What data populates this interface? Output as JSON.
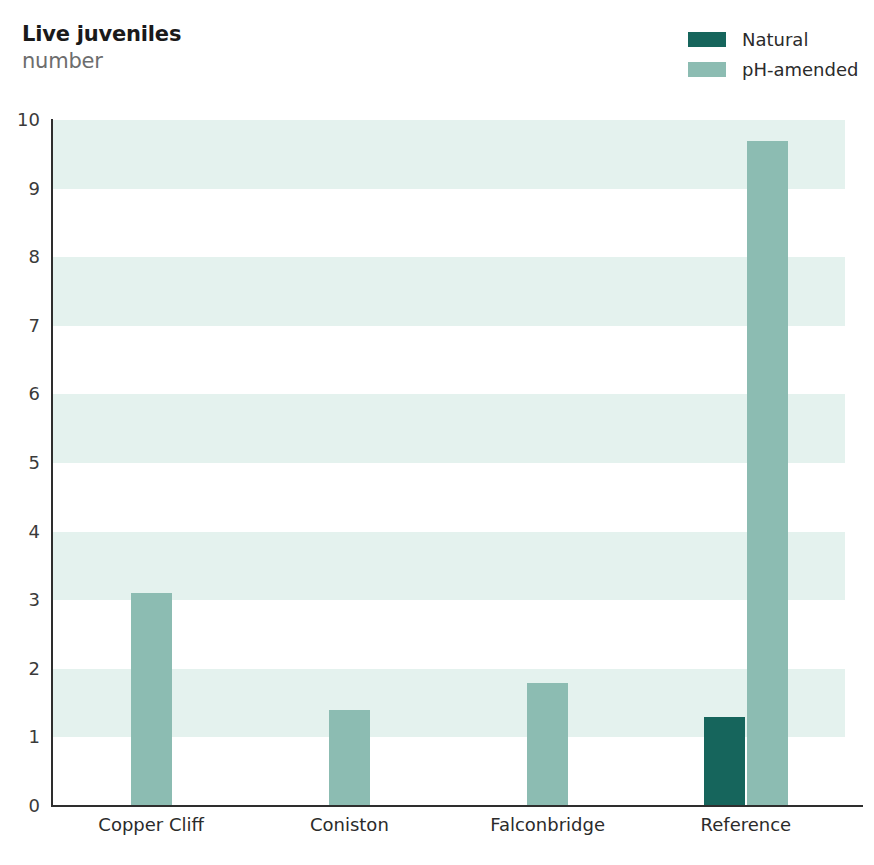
{
  "header": {
    "title": "Live juveniles",
    "subtitle": "number"
  },
  "legend": {
    "position": "top-right",
    "items": [
      {
        "label": "Natural",
        "color": "#16655c",
        "icon": "legend-swatch"
      },
      {
        "label": "pH-amended",
        "color": "#8cbcb2",
        "icon": "legend-swatch"
      }
    ]
  },
  "colors": {
    "natural": "#16655c",
    "ph_amended": "#8cbcb2",
    "band_shaded": "#e4f2ee",
    "band_plain": "#ffffff",
    "axis": "#2e2e2e",
    "title": "#1a1a1a",
    "subtitle": "#6d6d6d",
    "tick_text": "#3a3a3a"
  },
  "chart_data": {
    "type": "bar",
    "title": "Live juveniles",
    "subtitle": "number",
    "xlabel": "",
    "ylabel": "number",
    "ylim": [
      0,
      10
    ],
    "yticks": [
      0,
      1,
      2,
      3,
      4,
      5,
      6,
      7,
      8,
      9,
      10
    ],
    "ytick_labels": [
      "0",
      "1",
      "2",
      "3",
      "4",
      "5",
      "6",
      "7",
      "8",
      "9",
      "10"
    ],
    "categories": [
      "Copper Cliff",
      "Coniston",
      "Falconbridge",
      "Reference"
    ],
    "grid": false,
    "banded_background": true,
    "legend_position": "top-right",
    "series": [
      {
        "name": "Natural",
        "color": "#16655c",
        "values": [
          null,
          null,
          null,
          1.3
        ]
      },
      {
        "name": "pH-amended",
        "color": "#8cbcb2",
        "values": [
          3.1,
          1.4,
          1.8,
          9.7
        ]
      }
    ],
    "bars": [
      {
        "category": "Copper Cliff",
        "series": "pH-amended",
        "value": 3.1
      },
      {
        "category": "Coniston",
        "series": "pH-amended",
        "value": 1.4
      },
      {
        "category": "Falconbridge",
        "series": "pH-amended",
        "value": 1.8
      },
      {
        "category": "Reference",
        "series": "Natural",
        "value": 1.3
      },
      {
        "category": "Reference",
        "series": "pH-amended",
        "value": 9.7
      }
    ]
  },
  "footer": {
    "cut_off_text": ""
  }
}
